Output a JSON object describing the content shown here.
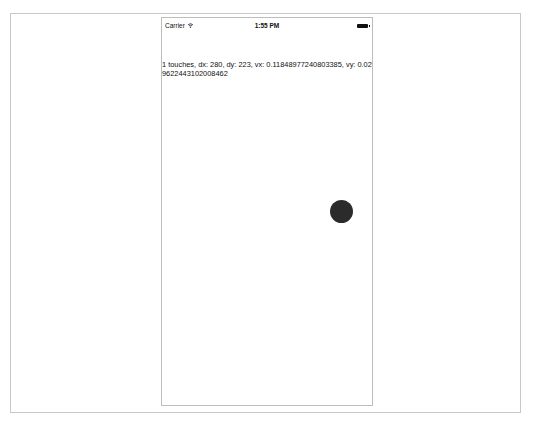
{
  "status_bar": {
    "carrier": "Carrier",
    "wifi_icon": "wifi-icon",
    "time": "1:55 PM",
    "battery_icon": "battery-full-icon"
  },
  "main": {
    "touch_info": "1 touches, dx: 280, dy: 223, vx: 0.11848977240803385, vy: 0.029622443102008462"
  },
  "touch_indicator": {
    "color": "#2b2b2b"
  }
}
